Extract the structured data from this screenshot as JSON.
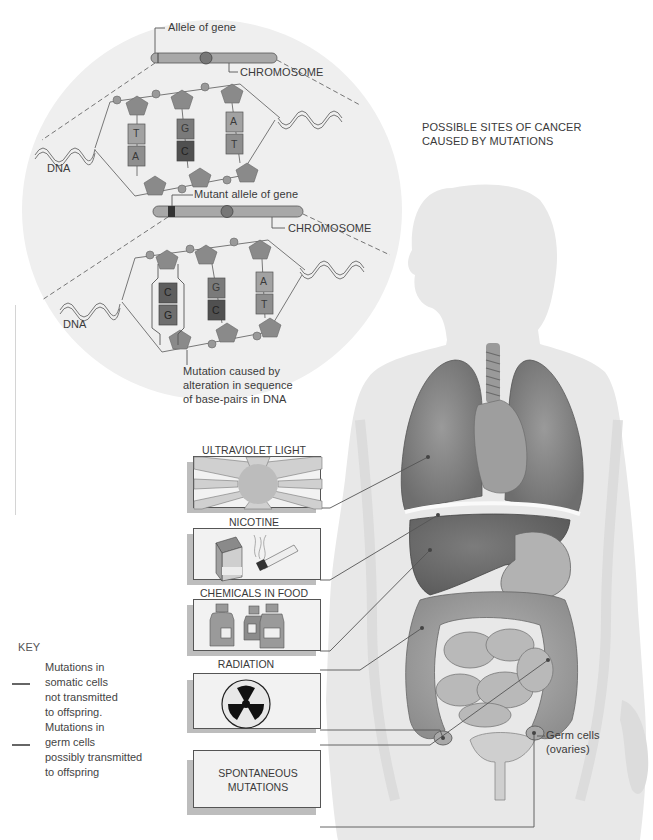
{
  "title": {
    "line1": "POSSIBLE SITES OF CANCER",
    "line2": "CAUSED BY MUTATIONS"
  },
  "dna_inset": {
    "normal": {
      "allele_label": "Allele of gene",
      "chromosome_label": "CHROMOSOME",
      "dna_label": "DNA",
      "base_pairs": [
        {
          "top": "T",
          "bottom": "A"
        },
        {
          "top": "G",
          "bottom": "C"
        },
        {
          "top": "A",
          "bottom": "T"
        }
      ]
    },
    "mutant": {
      "allele_label": "Mutant allele of gene",
      "chromosome_label": "CHROMOSOME",
      "dna_label": "DNA",
      "base_pairs": [
        {
          "top": "C",
          "bottom": "G"
        },
        {
          "top": "G",
          "bottom": "C"
        },
        {
          "top": "A",
          "bottom": "T"
        }
      ],
      "mutation_caption": {
        "line1": "Mutation caused by",
        "line2": "alteration in sequence",
        "line3": "of base-pairs in DNA"
      }
    }
  },
  "causes": [
    {
      "label": "ULTRAVIOLET LIGHT",
      "icon": "sun-rays-icon",
      "target": "lung"
    },
    {
      "label": "NICOTINE",
      "icon": "cigarette-pack-icon",
      "target": "lung"
    },
    {
      "label": "CHEMICALS IN FOOD",
      "icon": "bottles-icon",
      "target": "liver"
    },
    {
      "label": "RADIATION",
      "icon": "radiation-trefoil-icon",
      "target": "colon"
    },
    {
      "label": "SPONTANEOUS",
      "label2": "MUTATIONS",
      "icon": "none",
      "target": "ovaries"
    }
  ],
  "organ_labels": {
    "ovaries_line1": "Germ cells",
    "ovaries_line2": "(ovaries)"
  },
  "key": {
    "title": "KEY",
    "items": [
      {
        "lines": [
          "Mutations in",
          "somatic cells",
          "not transmitted",
          "to offspring."
        ]
      },
      {
        "lines": [
          "Mutations in",
          "germ cells",
          "possibly transmitted",
          "to offspring"
        ]
      }
    ]
  },
  "colors": {
    "background": "#ffffff",
    "inset_circle": "#efefef",
    "body_silhouette": "#e6e6e6",
    "organ_dark": "#7a7a7a",
    "organ_mid": "#a4a4a4",
    "box_fill": "#f2f2f2",
    "box_shadow": "#bdbdbd",
    "line": "#555555"
  }
}
